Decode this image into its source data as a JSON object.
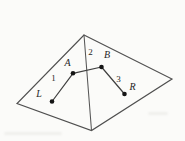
{
  "figure": {
    "width": 185,
    "height": 141,
    "colors": {
      "background": "#fbfbf9",
      "outline_stroke": "#4f4f4f",
      "fold_stroke": "#565656",
      "segment_stroke": "#3f3f3f",
      "point_fill": "#151515",
      "label_color": "#262626"
    },
    "outline_vertices": [
      {
        "name": "apex",
        "x": 84,
        "y": 35
      },
      {
        "name": "right",
        "x": 172,
        "y": 79
      },
      {
        "name": "bottom",
        "x": 91.5,
        "y": 130.5
      },
      {
        "name": "left",
        "x": 17,
        "y": 103.5
      }
    ],
    "fold_line": {
      "x1": 84,
      "y1": 35,
      "x2": 91.5,
      "y2": 130.5
    },
    "points": {
      "A": {
        "x": 73,
        "y": 73.3
      },
      "B": {
        "x": 101.5,
        "y": 67
      },
      "L": {
        "x": 52,
        "y": 101.5
      },
      "R": {
        "x": 124.5,
        "y": 94
      }
    },
    "point_radius": 2.3,
    "segments": [
      {
        "id": "segment-L-A",
        "from": "L",
        "to": "A"
      },
      {
        "id": "segment-A-B",
        "from": "A",
        "to": "B"
      },
      {
        "id": "segment-B-R",
        "from": "B",
        "to": "R"
      }
    ],
    "point_labels": [
      {
        "text": "A",
        "x": 67.5,
        "y": 63.5
      },
      {
        "text": "B",
        "x": 107,
        "y": 56
      },
      {
        "text": "L",
        "x": 39,
        "y": 95
      },
      {
        "text": "R",
        "x": 132.5,
        "y": 87.5
      }
    ],
    "number_labels": [
      {
        "text": "1",
        "x": 53.5,
        "y": 78.5
      },
      {
        "text": "2",
        "x": 90.5,
        "y": 52.5
      },
      {
        "text": "3",
        "x": 118.5,
        "y": 80
      }
    ]
  }
}
